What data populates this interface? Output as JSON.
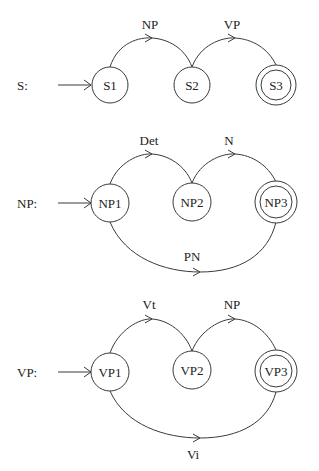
{
  "diagram": {
    "type": "recursive-transition-network",
    "networks": [
      {
        "name": "S",
        "label": "S:",
        "states": [
          {
            "id": "S1",
            "label": "S1",
            "start": true,
            "final": false
          },
          {
            "id": "S2",
            "label": "S2",
            "start": false,
            "final": false
          },
          {
            "id": "S3",
            "label": "S3",
            "start": false,
            "final": true
          }
        ],
        "arcs": [
          {
            "from": "S1",
            "to": "S2",
            "label": "NP",
            "position": "top"
          },
          {
            "from": "S2",
            "to": "S3",
            "label": "VP",
            "position": "top"
          }
        ]
      },
      {
        "name": "NP",
        "label": "NP:",
        "states": [
          {
            "id": "NP1",
            "label": "NP1",
            "start": true,
            "final": false
          },
          {
            "id": "NP2",
            "label": "NP2",
            "start": false,
            "final": false
          },
          {
            "id": "NP3",
            "label": "NP3",
            "start": false,
            "final": true
          }
        ],
        "arcs": [
          {
            "from": "NP1",
            "to": "NP2",
            "label": "Det",
            "position": "top"
          },
          {
            "from": "NP2",
            "to": "NP3",
            "label": "N",
            "position": "top"
          },
          {
            "from": "NP1",
            "to": "NP3",
            "label": "PN",
            "position": "bottom"
          }
        ]
      },
      {
        "name": "VP",
        "label": "VP:",
        "states": [
          {
            "id": "VP1",
            "label": "VP1",
            "start": true,
            "final": false
          },
          {
            "id": "VP2",
            "label": "VP2",
            "start": false,
            "final": false
          },
          {
            "id": "VP3",
            "label": "VP3",
            "start": false,
            "final": true
          }
        ],
        "arcs": [
          {
            "from": "VP1",
            "to": "VP2",
            "label": "Vt",
            "position": "top"
          },
          {
            "from": "VP2",
            "to": "VP3",
            "label": "NP",
            "position": "top"
          },
          {
            "from": "VP1",
            "to": "VP3",
            "label": "Vi",
            "position": "bottom"
          }
        ]
      }
    ]
  },
  "colors": {
    "stroke": "#3a3a3a",
    "text": "#222222",
    "background": "#ffffff"
  }
}
